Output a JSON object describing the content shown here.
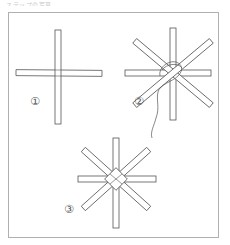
{
  "caption": {
    "text": "ステップの写真"
  },
  "figure": {
    "steps": [
      {
        "number": 1,
        "label": "①",
        "description": "Two sticks crossed at right angles"
      },
      {
        "number": 2,
        "label": "②",
        "description": "Four sticks crossed into an eight-pointed star, tied with thread at the center"
      },
      {
        "number": 3,
        "label": "③",
        "description": "Finished eight-pointed star with woven center"
      }
    ]
  },
  "colors": {
    "line": "#555555",
    "frame": "#b0b0b0",
    "background": "#ffffff"
  }
}
